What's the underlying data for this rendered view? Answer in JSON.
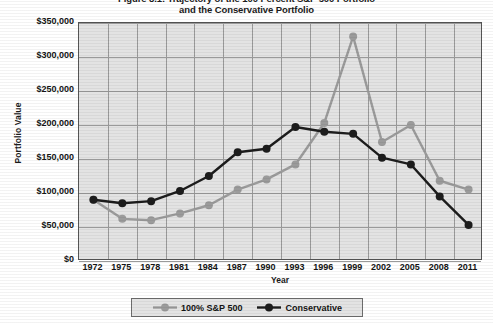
{
  "figure": {
    "title_lines": [
      "Figure 8.1: Trajectory of the 100 Percent S&P 500 Portfolio",
      "and the Conservative Portfolio"
    ]
  },
  "axes": {
    "ylabel": "Portfolio Value",
    "xlabel": "Year",
    "yticks": [
      "$0",
      "$50,000",
      "$100,000",
      "$150,000",
      "$200,000",
      "$250,000",
      "$300,000",
      "$350,000"
    ],
    "xticks": [
      "1972",
      "1975",
      "1978",
      "1981",
      "1984",
      "1987",
      "1990",
      "1993",
      "1996",
      "1999",
      "2002",
      "2005",
      "2008",
      "2011"
    ]
  },
  "legend": {
    "items": [
      {
        "label": "100% S&P 500",
        "color": "#9b9b9b"
      },
      {
        "label": "Conservative",
        "color": "#1c1c1c"
      }
    ]
  },
  "chart_data": {
    "type": "line",
    "title": "Figure 8.1: Trajectory of the 100 Percent S&P 500 Portfolio and the Conservative Portfolio",
    "xlabel": "Year",
    "ylabel": "Portfolio Value",
    "x": [
      1972,
      1975,
      1978,
      1981,
      1984,
      1987,
      1990,
      1993,
      1996,
      1999,
      2002,
      2005,
      2008,
      2011
    ],
    "categories": [
      "1972",
      "1975",
      "1978",
      "1981",
      "1984",
      "1987",
      "1990",
      "1993",
      "1996",
      "1999",
      "2002",
      "2005",
      "2008",
      "2011"
    ],
    "series": [
      {
        "name": "100% S&P 500",
        "color": "#9b9b9b",
        "values": [
          90000,
          62000,
          60000,
          70000,
          82000,
          105000,
          120000,
          142000,
          203000,
          330000,
          175000,
          200000,
          118000,
          105000
        ]
      },
      {
        "name": "Conservative",
        "color": "#1c1c1c",
        "values": [
          90000,
          85000,
          88000,
          103000,
          125000,
          160000,
          165000,
          197000,
          190000,
          187000,
          152000,
          142000,
          95000,
          53000
        ]
      }
    ],
    "ylim": [
      0,
      350000
    ],
    "ytick_step": 50000,
    "xlim": [
      1972,
      2011
    ],
    "grid": true,
    "legend_position": "bottom"
  },
  "style": {
    "plot_bg": "#e3e3e3",
    "grid_color": "#9a9a9a",
    "frame_color": "#555555"
  }
}
